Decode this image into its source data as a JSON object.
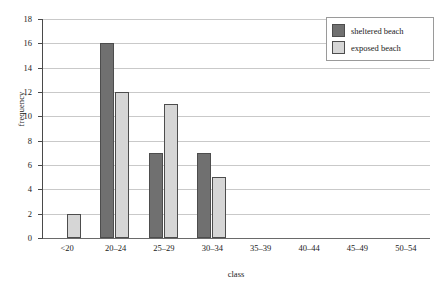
{
  "chart_data": {
    "type": "bar",
    "title": "",
    "xlabel": "class",
    "ylabel": "frequency",
    "categories": [
      "<20",
      "20–24",
      "25–29",
      "30–34",
      "35–39",
      "40–44",
      "45–49",
      "50–54"
    ],
    "series": [
      {
        "name": "sheltered beach",
        "color": "#707070",
        "values": [
          0,
          16,
          7,
          7,
          0,
          0,
          0,
          0
        ]
      },
      {
        "name": "exposed beach",
        "color": "#d6d6d6",
        "values": [
          2,
          12,
          11,
          5,
          0,
          0,
          0,
          0
        ]
      }
    ],
    "ylim": [
      0,
      18
    ],
    "ytick_values": [
      0,
      2,
      4,
      6,
      8,
      10,
      12,
      14,
      16,
      18
    ],
    "ytick_labels": [
      "0",
      "2",
      "4",
      "6",
      "8",
      "10",
      "12",
      "14",
      "16",
      "18"
    ],
    "grid": "horizontal",
    "legend_position": "top-right",
    "bar_border_color": "#4d4d4d",
    "gridline_color": "#c9c9c9",
    "axis_color": "#4a4a4a",
    "background": "#ffffff"
  },
  "legend": {
    "entries": [
      {
        "label": "sheltered beach"
      },
      {
        "label": "exposed beach"
      }
    ]
  }
}
